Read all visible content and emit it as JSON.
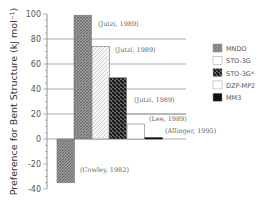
{
  "chart_data": {
    "type": "bar",
    "title": "",
    "xlabel": "",
    "ylabel": "Preference for Bent Structure (kJ mol⁻¹)",
    "ylim": [
      -40,
      100
    ],
    "yticks": [
      100,
      80,
      60,
      40,
      20,
      0,
      -20,
      -40
    ],
    "grid": "horizontal lines at 80, 60, 40, 20, 0",
    "legend_position": "right",
    "legend": [
      {
        "name": "MNDO",
        "pattern": "fine-crosshatch",
        "color": "#8a8a8a"
      },
      {
        "name": "STO-3G",
        "pattern": "light-diagonal",
        "color": "#f2f2f2"
      },
      {
        "name": "STO-3G*",
        "pattern": "dark-diagonal",
        "color": "#222222"
      },
      {
        "name": "DZP-MP2",
        "pattern": "plain",
        "color": "#ffffff"
      },
      {
        "name": "MM3",
        "pattern": "solid",
        "color": "#111111"
      }
    ],
    "bars": [
      {
        "method": "MNDO",
        "value": -35,
        "annotation": "(Cowley, 1982)"
      },
      {
        "method": "MNDO",
        "value": 99,
        "annotation": "(Jutzi, 1989)"
      },
      {
        "method": "STO-3G",
        "value": 74,
        "annotation": "(Jutzi, 1989)"
      },
      {
        "method": "STO-3G*",
        "value": 49,
        "annotation": "(Jutzi, 1989)"
      },
      {
        "method": "DZP-MP2",
        "value": 12,
        "annotation": "(Lee, 1989)"
      },
      {
        "method": "MM3",
        "value": 1,
        "annotation": "(Allinger, 1995)"
      }
    ]
  }
}
